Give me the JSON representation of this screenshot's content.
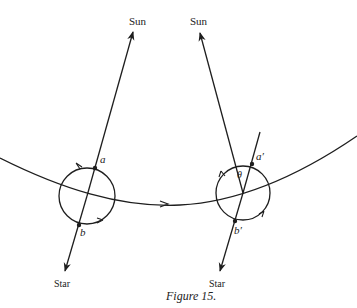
{
  "figure": {
    "caption": "Figure 15.",
    "colors": {
      "ink": "#1e1e1e",
      "background": "#ffffff"
    },
    "left_position": {
      "sun_label": "Sun",
      "star_label": "Star",
      "point_a": "a",
      "point_b": "b"
    },
    "right_position": {
      "sun_label": "Sun",
      "star_label": "Star",
      "point_a": "a′",
      "point_b": "b′",
      "angle": "θ"
    }
  }
}
